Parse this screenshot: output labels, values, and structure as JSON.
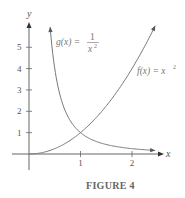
{
  "chart_data": {
    "type": "line",
    "title": "",
    "caption": "FIGURE 4",
    "xlabel": "x",
    "ylabel": "y",
    "xlim": [
      -0.1,
      2.6
    ],
    "ylim": [
      -0.3,
      6.2
    ],
    "x_ticks": [
      1,
      2
    ],
    "y_ticks": [
      1,
      2,
      3,
      4,
      5
    ],
    "grid": false,
    "series": [
      {
        "name": "f(x) = x^2",
        "label_main": "f(x) = x",
        "label_sup": "2",
        "x": [
          0,
          0.25,
          0.5,
          0.75,
          1,
          1.25,
          1.5,
          1.75,
          2,
          2.25,
          2.45
        ],
        "values": [
          0,
          0.0625,
          0.25,
          0.5625,
          1,
          1.5625,
          2.25,
          3.0625,
          4,
          5.0625,
          6.0
        ]
      },
      {
        "name": "g(x) = 1/x^2",
        "label_main": "g(x) =",
        "label_num": "1",
        "label_den": "x",
        "label_den_sup": "2",
        "x": [
          0.41,
          0.5,
          0.6,
          0.75,
          1,
          1.25,
          1.5,
          1.75,
          2,
          2.25,
          2.45
        ],
        "values": [
          5.95,
          4,
          2.78,
          1.78,
          1,
          0.64,
          0.44,
          0.33,
          0.25,
          0.2,
          0.17
        ]
      }
    ],
    "intersection": {
      "x": 1,
      "y": 1
    }
  }
}
